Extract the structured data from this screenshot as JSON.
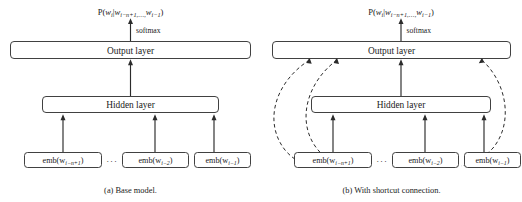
{
  "figure": {
    "panels": [
      {
        "id": "base-model",
        "caption": "(a) Base model.",
        "output_probability": "P(wᵢ|wᵢ₋ₙ₊₁,…,wᵢ₋₁)",
        "softmax_label": "softmax",
        "output_layer_label": "Output layer",
        "hidden_layer_label": "Hidden layer",
        "ellipsis": "···",
        "embeddings": [
          {
            "label": "emb(wᵢ₋ₙ₊₁)",
            "base": "emb(w",
            "sub": "i−n+1",
            "close": ")"
          },
          {
            "label": "emb(wᵢ₋₂)",
            "base": "emb(w",
            "sub": "i−2",
            "close": ")"
          },
          {
            "label": "emb(wᵢ₋₁)",
            "base": "emb(w",
            "sub": "i−1",
            "close": ")"
          }
        ],
        "has_shortcut_connections": "false"
      },
      {
        "id": "shortcut-model",
        "caption": "(b) With shortcut connection.",
        "output_probability": "P(wᵢ|wᵢ₋ₙ₊₁,…,wᵢ₋₁)",
        "softmax_label": "softmax",
        "output_layer_label": "Output layer",
        "hidden_layer_label": "Hidden layer",
        "ellipsis": "···",
        "embeddings": [
          {
            "label": "emb(wᵢ₋ₙ₊₁)",
            "base": "emb(w",
            "sub": "i−n+1",
            "close": ")"
          },
          {
            "label": "emb(wᵢ₋₂)",
            "base": "emb(w",
            "sub": "i−2",
            "close": ")"
          },
          {
            "label": "emb(wᵢ₋₁)",
            "base": "emb(w",
            "sub": "i−1",
            "close": ")"
          }
        ],
        "has_shortcut_connections": "true"
      }
    ],
    "probability_parts": {
      "p": "P(",
      "w_main": "w",
      "w_main_sub": "i",
      "bar": "|",
      "w_first": "w",
      "w_first_sub": "i−n+1",
      "comma_dots": ",…,",
      "w_last": "w",
      "w_last_sub": "i−1",
      "close": ")"
    },
    "colors": {
      "background": "#ffffff",
      "stroke": "#2b2b2b",
      "text": "#1a1a1a",
      "box_fill": "#ffffff"
    }
  }
}
